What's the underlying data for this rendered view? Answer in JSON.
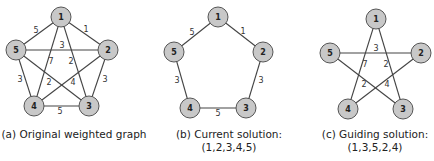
{
  "panels": [
    {
      "id": "a",
      "caption_line1": "(a) Original weighted graph",
      "caption_line2": "",
      "nodes": [
        {
          "id": "1",
          "x": 61,
          "y": 17
        },
        {
          "id": "2",
          "x": 108,
          "y": 50
        },
        {
          "id": "3",
          "x": 89,
          "y": 106
        },
        {
          "id": "4",
          "x": 34,
          "y": 106
        },
        {
          "id": "5",
          "x": 16,
          "y": 50
        }
      ],
      "edges": [
        {
          "from": "1",
          "to": "2",
          "weight": "1",
          "lx": 86,
          "ly": 29
        },
        {
          "from": "1",
          "to": "5",
          "weight": "5",
          "lx": 36,
          "ly": 30
        },
        {
          "from": "5",
          "to": "2",
          "weight": "3",
          "lx": 62,
          "ly": 45
        },
        {
          "from": "1",
          "to": "4",
          "weight": "7",
          "lx": 51,
          "ly": 61
        },
        {
          "from": "1",
          "to": "3",
          "weight": "2",
          "lx": 71,
          "ly": 61
        },
        {
          "from": "5",
          "to": "3",
          "weight": "2",
          "lx": 49,
          "ly": 82
        },
        {
          "from": "4",
          "to": "2",
          "weight": "4",
          "lx": 73,
          "ly": 82
        },
        {
          "from": "2",
          "to": "3",
          "weight": "3",
          "lx": 105,
          "ly": 79
        },
        {
          "from": "5",
          "to": "4",
          "weight": "3",
          "lx": 20,
          "ly": 79
        },
        {
          "from": "4",
          "to": "3",
          "weight": "5",
          "lx": 60,
          "ly": 111
        }
      ]
    },
    {
      "id": "b",
      "caption_line1": "(b) Current solution:",
      "caption_line2": "(1,2,3,4,5)",
      "nodes": [
        {
          "id": "1",
          "x": 218,
          "y": 17
        },
        {
          "id": "2",
          "x": 263,
          "y": 52
        },
        {
          "id": "3",
          "x": 246,
          "y": 108
        },
        {
          "id": "4",
          "x": 190,
          "y": 108
        },
        {
          "id": "5",
          "x": 174,
          "y": 52
        }
      ],
      "edges": [
        {
          "from": "1",
          "to": "2",
          "weight": "1",
          "lx": 243,
          "ly": 31
        },
        {
          "from": "2",
          "to": "3",
          "weight": "3",
          "lx": 261,
          "ly": 80
        },
        {
          "from": "3",
          "to": "4",
          "weight": "5",
          "lx": 218,
          "ly": 113
        },
        {
          "from": "4",
          "to": "5",
          "weight": "3",
          "lx": 177,
          "ly": 80
        },
        {
          "from": "5",
          "to": "1",
          "weight": "5",
          "lx": 192,
          "ly": 32
        }
      ]
    },
    {
      "id": "c",
      "caption_line1": "(c) Guiding solution:",
      "caption_line2": "(1,3,5,2,4)",
      "nodes": [
        {
          "id": "1",
          "x": 376,
          "y": 19
        },
        {
          "id": "2",
          "x": 421,
          "y": 53
        },
        {
          "id": "3",
          "x": 403,
          "y": 109
        },
        {
          "id": "4",
          "x": 348,
          "y": 109
        },
        {
          "id": "5",
          "x": 330,
          "y": 53
        }
      ],
      "edges": [
        {
          "from": "1",
          "to": "3",
          "weight": "2",
          "lx": 386,
          "ly": 64
        },
        {
          "from": "3",
          "to": "5",
          "weight": "2",
          "lx": 364,
          "ly": 84
        },
        {
          "from": "5",
          "to": "2",
          "weight": "3",
          "lx": 376,
          "ly": 48
        },
        {
          "from": "2",
          "to": "4",
          "weight": "4",
          "lx": 387,
          "ly": 84
        },
        {
          "from": "4",
          "to": "1",
          "weight": "7",
          "lx": 365,
          "ly": 64
        }
      ]
    }
  ]
}
